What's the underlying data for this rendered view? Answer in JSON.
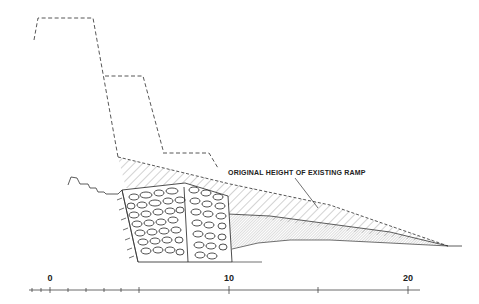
{
  "diagram": {
    "annotation": "ORIGINAL HEIGHT OF EXISTING RAMP",
    "scale": {
      "labels": [
        {
          "text": "0",
          "x": 50
        },
        {
          "text": "10",
          "x": 229
        },
        {
          "text": "20",
          "x": 408
        }
      ],
      "minor_ticks_x": [
        32,
        41,
        50,
        68,
        86,
        104,
        121,
        139
      ],
      "major_ticks_x": [
        139,
        229,
        318,
        408
      ]
    },
    "colors": {
      "line": "#333333",
      "hatch": "#555555"
    }
  }
}
